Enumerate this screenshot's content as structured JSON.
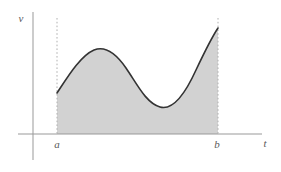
{
  "figure": {
    "background_color": "#ffffff",
    "width": 281,
    "height": 172
  },
  "axes": {
    "vertical": {
      "label": "v",
      "color": "#999999",
      "x": 33,
      "y_top": 12,
      "y_bottom": 160,
      "label_x": 21,
      "label_y": 22
    },
    "horizontal": {
      "label": "t",
      "color": "#999999",
      "y": 134,
      "x_left": 18,
      "x_right": 262,
      "label_x": 263,
      "label_y": 147
    }
  },
  "boundaries": [
    {
      "name": "lower-limit",
      "label": "a",
      "x": 57,
      "y_top": 18,
      "y_bottom": 134,
      "label_x": 54,
      "label_y": 148,
      "style": "dashed",
      "color": "#b0b0b0"
    },
    {
      "name": "upper-limit",
      "label": "b",
      "x": 218,
      "y_top": 18,
      "y_bottom": 134,
      "label_x": 214,
      "label_y": 148,
      "style": "dashed",
      "color": "#b0b0b0"
    }
  ],
  "region": {
    "name": "shaded-area-under-curve",
    "fill_color": "#d2d2d2",
    "from": "a",
    "to": "b"
  },
  "curve": {
    "name": "velocity-curve",
    "stroke_color": "#333333",
    "stroke_width": 1.6,
    "path": "M 57 93 C 67 78, 80 56, 94 50 C 104 46, 115 52, 126 68 C 137 84, 146 103, 160 107 C 174 111, 186 92, 196 70 C 205 51, 212 37, 218 28"
  },
  "chart_data": {
    "type": "area",
    "title": "",
    "xlabel": "t",
    "ylabel": "v",
    "grid": false,
    "legend": null,
    "x_markers": [
      "a",
      "b"
    ],
    "annotations": [
      "shaded region between t = a and t = b under the velocity curve"
    ],
    "points": [
      {
        "t": "a",
        "v": 0.36,
        "note": "left endpoint of curve at t = a"
      },
      {
        "t": "peak",
        "v": 0.69,
        "note": "local maximum"
      },
      {
        "t": "trough",
        "v": 0.22,
        "note": "local minimum"
      },
      {
        "t": "b",
        "v": 0.87,
        "note": "right endpoint of curve at t = b"
      }
    ],
    "series": [
      {
        "name": "v(t)",
        "x": [
          57,
          70,
          85,
          94,
          103,
          115,
          126,
          140,
          152,
          162,
          175,
          190,
          203,
          212,
          218
        ],
        "values": [
          93,
          75,
          57,
          50,
          50,
          58,
          68,
          88,
          101,
          107,
          104,
          86,
          60,
          42,
          28
        ],
        "y_axis_note": "values are pixel rows measured down from the top; the baseline (v = 0) is row 134"
      }
    ],
    "xlim": [
      18,
      262
    ],
    "ylim": [
      134,
      12
    ]
  }
}
